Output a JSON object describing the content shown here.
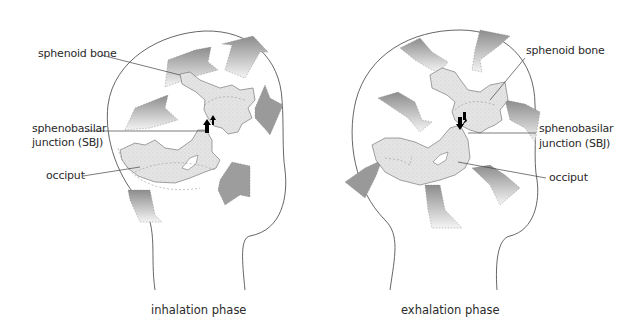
{
  "panels": [
    {
      "id": "inhalation",
      "caption": "inhalation phase",
      "labels": {
        "sphenoid": "sphenoid bone",
        "sbj_line1": "sphenobasilar",
        "sbj_line2": "junction (SBJ)",
        "occiput": "occiput"
      }
    },
    {
      "id": "exhalation",
      "caption": "exhalation phase",
      "labels": {
        "sphenoid": "sphenoid bone",
        "sbj_line1": "sphenobasilar",
        "sbj_line2": "junction (SBJ)",
        "occiput": "occiput"
      }
    }
  ],
  "colors": {
    "outline": "#555555",
    "bone_fill": "#e3e3e3",
    "arrow_dark": "#8a8a8a",
    "arrow_light": "#f2f2f2",
    "sbj_arrow": "#000000"
  },
  "arrow_directions": {
    "inhalation": "outward",
    "exhalation": "inward"
  }
}
